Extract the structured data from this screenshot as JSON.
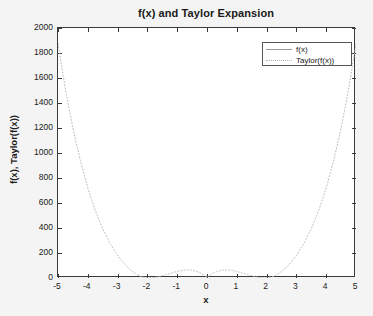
{
  "chart_data": {
    "type": "line",
    "title": "f(x) and Taylor Expansion",
    "xlabel": "x",
    "ylabel": "f(x), Taylor(f(x))",
    "xlim": [
      -5,
      5
    ],
    "ylim": [
      0,
      2000
    ],
    "xticks": [
      "-5",
      "-4",
      "-3",
      "-2",
      "-1",
      "0",
      "1",
      "2",
      "3",
      "4",
      "5"
    ],
    "yticks": [
      "0",
      "200",
      "400",
      "600",
      "800",
      "1000",
      "1200",
      "1400",
      "1600",
      "1800",
      "2000"
    ],
    "grid": false,
    "legend_position": "upper right",
    "series": [
      {
        "name": "f(x)",
        "style": "solid",
        "color": "#9a9a9a",
        "visible_in_plot": false,
        "x": [],
        "values": []
      },
      {
        "name": "Taylor(f(x))",
        "style": "dotted",
        "color": "#b4b4b4",
        "visible_in_plot": true,
        "x": [
          -5,
          -4.75,
          -4.5,
          -4.25,
          -4,
          -3.75,
          -3.5,
          -3.25,
          -3,
          -2.75,
          -2.5,
          -2.25,
          -2,
          -1.75,
          -1.5,
          -1.25,
          -1,
          -0.75,
          -0.5,
          -0.25,
          0,
          0.25,
          0.5,
          0.75,
          1,
          1.25,
          1.5,
          1.75,
          2,
          2.25,
          2.5,
          2.75,
          3,
          3.25,
          3.5,
          3.75,
          4,
          4.25,
          4.5,
          4.75,
          5
        ],
        "values": [
          1875,
          1508,
          1198,
          938,
          720,
          541,
          394,
          275,
          180,
          106,
          51,
          14,
          0,
          4,
          18,
          36,
          53,
          64,
          63,
          45,
          8,
          45,
          63,
          64,
          53,
          36,
          18,
          4,
          0,
          14,
          51,
          106,
          180,
          275,
          394,
          541,
          720,
          938,
          1198,
          1508,
          1875
        ]
      }
    ]
  },
  "figure": {
    "background_color": "#f4f4f4",
    "plot_background_color": "#ffffff",
    "axis_color": "#3a3a3a"
  }
}
